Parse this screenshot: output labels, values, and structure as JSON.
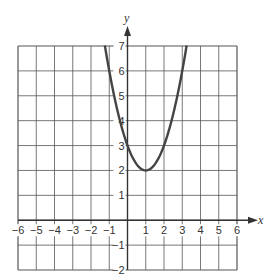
{
  "chart_data": {
    "type": "line",
    "title": "",
    "xlabel": "x",
    "ylabel": "y",
    "xlim": [
      -6,
      6
    ],
    "ylim": [
      -2,
      7
    ],
    "grid": true,
    "x_ticks": [
      "-6",
      "-5",
      "-4",
      "-3",
      "-2",
      "-1",
      "1",
      "2",
      "3",
      "4",
      "5",
      "6"
    ],
    "y_ticks": [
      "7",
      "6",
      "5",
      "4",
      "3",
      "2",
      "1",
      "-1",
      "-2"
    ],
    "series": [
      {
        "name": "y = (x - 1)^2 + 2",
        "equation": "y = x^2 - 2x + 3",
        "vertex": [
          1,
          2
        ],
        "y_intercept": 3,
        "x": [
          -1.24,
          -1,
          -0.5,
          0,
          0.5,
          1,
          1.5,
          2,
          2.5,
          3,
          3.24
        ],
        "y": [
          7,
          6,
          4.25,
          3,
          2.25,
          2,
          2.25,
          3,
          4.25,
          6,
          7
        ],
        "color": "#444444"
      }
    ]
  },
  "labels": {
    "x_axis": "x",
    "y_axis": "y"
  },
  "colors": {
    "grid": "#555555",
    "curve": "#444444",
    "text": "#333333"
  }
}
